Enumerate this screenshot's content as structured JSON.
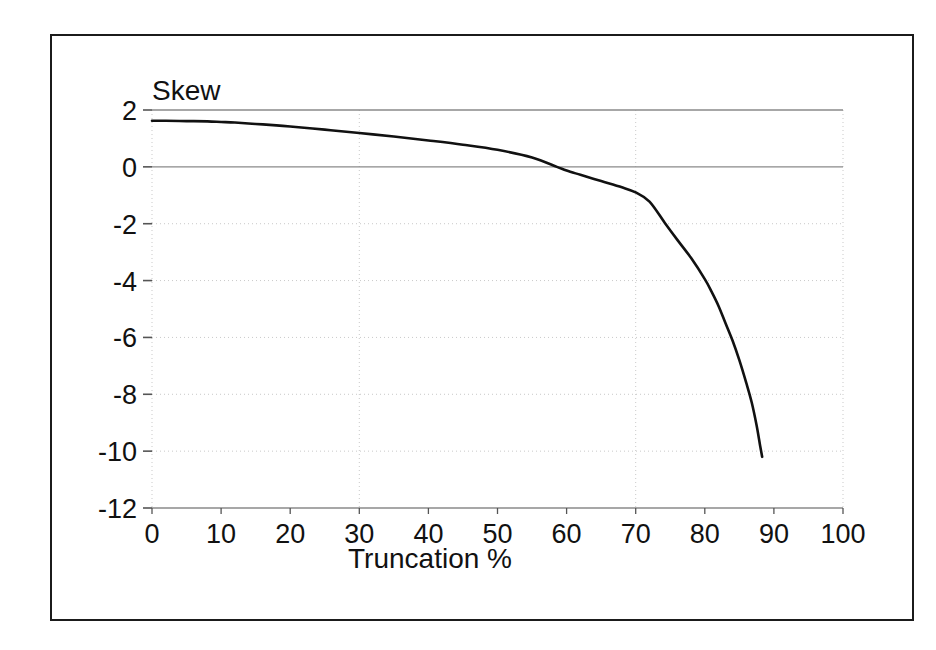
{
  "figure": {
    "background_color": "#ffffff",
    "frame_color": "#1b1b1b",
    "plot_line_color": "#111111",
    "grid_color": "#c9c9c9",
    "axis_color": "#8a8a8a"
  },
  "chart_data": {
    "type": "line",
    "title": "",
    "series_label": "Skew",
    "xlabel": "Truncation %",
    "ylabel": "Skew",
    "xlim": [
      0,
      100
    ],
    "ylim": [
      -12,
      2
    ],
    "xticks": [
      0,
      10,
      20,
      30,
      40,
      50,
      60,
      70,
      80,
      90,
      100
    ],
    "xtick_labels": [
      "0",
      "10",
      "20",
      "30",
      "40",
      "50",
      "60",
      "70",
      "80",
      "90",
      "100"
    ],
    "yticks": [
      2,
      0,
      -2,
      -4,
      -6,
      -8,
      -10,
      -12
    ],
    "ytick_labels": [
      "2",
      "0",
      "-2",
      "-4",
      "-6",
      "-8",
      "-10",
      "-12"
    ],
    "grid": true,
    "grid_style": "dotted",
    "vertical_gridlines_at": [
      0,
      30,
      70,
      100
    ],
    "horizontal_gridlines_at": [
      2,
      0,
      -2,
      -4,
      -6,
      -8,
      -10,
      -12
    ],
    "legend": "none",
    "x": [
      0,
      2,
      5,
      8,
      10,
      12,
      15,
      18,
      20,
      25,
      30,
      35,
      40,
      45,
      50,
      55,
      58.6,
      60,
      62,
      65,
      68,
      70,
      72,
      74.3,
      76,
      78,
      80,
      81,
      82,
      83,
      84,
      85,
      86,
      86.8,
      87.5,
      88,
      88.3
    ],
    "y": [
      1.62,
      1.62,
      1.61,
      1.6,
      1.58,
      1.56,
      1.51,
      1.46,
      1.42,
      1.31,
      1.19,
      1.07,
      0.93,
      0.78,
      0.6,
      0.33,
      0.0,
      -0.13,
      -0.28,
      -0.5,
      -0.72,
      -0.9,
      -1.22,
      -2.0,
      -2.56,
      -3.2,
      -3.95,
      -4.4,
      -4.9,
      -5.5,
      -6.1,
      -6.8,
      -7.6,
      -8.3,
      -9.1,
      -9.8,
      -10.2
    ],
    "start_value": 1.62,
    "end_value": -10.2,
    "end_x": 88.3,
    "zero_crossing_x": 58.6
  }
}
